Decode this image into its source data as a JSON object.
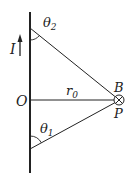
{
  "diagram": {
    "type": "physics-magnetic-field-finite-wire",
    "labels": {
      "current": "I",
      "origin": "O",
      "distance": "r",
      "distance_sub": "0",
      "field": "B",
      "point": "P",
      "theta1": "θ",
      "theta1_sub": "1",
      "theta2": "θ",
      "theta2_sub": "2"
    },
    "colors": {
      "line": "#222222",
      "background": "#ffffff"
    }
  }
}
